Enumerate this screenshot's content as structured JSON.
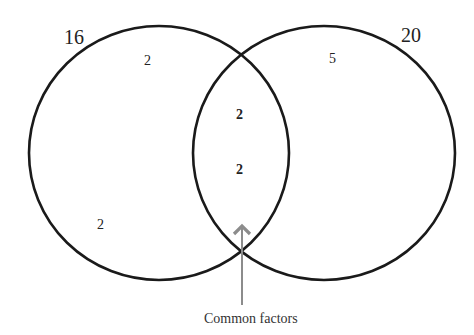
{
  "diagram": {
    "type": "venn",
    "sets": [
      {
        "name": "16",
        "exclusive_elements": [
          "2",
          "2"
        ]
      },
      {
        "name": "20",
        "exclusive_elements": [
          "5"
        ]
      }
    ],
    "intersection": {
      "elements": [
        "2",
        "2"
      ],
      "label": "Common factors"
    },
    "colors": {
      "circle_stroke": "#1a1a1a",
      "arrow": "#8c8c8c",
      "text": "#222222"
    }
  }
}
